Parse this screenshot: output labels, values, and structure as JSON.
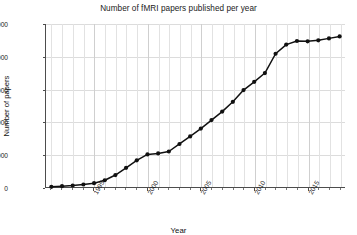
{
  "chart_data": {
    "type": "line",
    "title": "Number of fMRI papers published per year",
    "xlabel": "Year",
    "ylabel": "Number of papers",
    "xlim": [
      1990.5,
      2018.5
    ],
    "ylim": [
      0,
      5000
    ],
    "grid": true,
    "legend": null,
    "marker": "filled-circle",
    "line_color": "#111111",
    "marker_color": "#111111",
    "ytick_labels": [
      "0",
      "1,000",
      "2,000",
      "3,000",
      "4,000",
      "5,000"
    ],
    "ytick_values": [
      0,
      1000,
      2000,
      3000,
      4000,
      5000
    ],
    "xtick_labels": [
      "1995",
      "2000",
      "2005",
      "2010",
      "2015"
    ],
    "xtick_values": [
      1995,
      2000,
      2005,
      2010,
      2015
    ],
    "x": [
      1991,
      1992,
      1993,
      1994,
      1995,
      1996,
      1997,
      1998,
      1999,
      2000,
      2001,
      2002,
      2003,
      2004,
      2005,
      2006,
      2007,
      2008,
      2009,
      2010,
      2011,
      2012,
      2013,
      2014,
      2015,
      2016,
      2017,
      2018
    ],
    "values": [
      20,
      40,
      60,
      90,
      130,
      220,
      380,
      600,
      830,
      1010,
      1040,
      1100,
      1330,
      1560,
      1800,
      2060,
      2320,
      2620,
      2980,
      3230,
      3500,
      4090,
      4370,
      4480,
      4470,
      4500,
      4560,
      4620
    ]
  }
}
